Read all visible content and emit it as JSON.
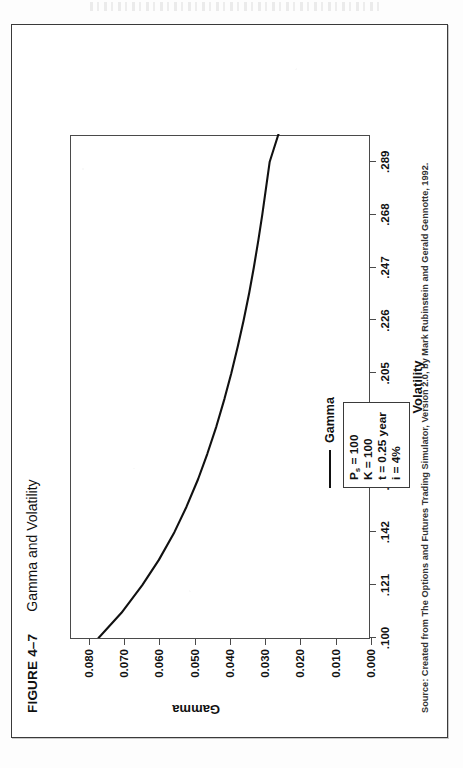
{
  "figure": {
    "number": "FIGURE 4–7",
    "title": "Gamma and Volatility"
  },
  "source_note": "Source: Created from The Options and Futures Trading Simulator, Version 2.0, by Mark Rubinstein and Gerald Gennotte, 1992.",
  "legend": {
    "series_label": "Gamma"
  },
  "parameters": {
    "lines": [
      "Pₛ = 100",
      "K = 100",
      "t = 0.25 year",
      "i = 4%"
    ],
    "spot_price": "Pₛ = 100",
    "strike": "K = 100",
    "time": "t = 0.25 year",
    "rate": "i = 4%"
  },
  "colors": {
    "ink": "#111111",
    "frame": "#3a3a3a",
    "axis": "#4a4a4a",
    "paper": "#fdfdfd",
    "curve": "#111111"
  },
  "chart_data": {
    "type": "line",
    "title": "Gamma and Volatility",
    "xlabel": "Volatility",
    "ylabel": "Gamma",
    "xlim": [
      0.1,
      0.3
    ],
    "ylim": [
      0.0,
      0.085
    ],
    "grid": false,
    "legend_position": "inside-bottom-left",
    "xtick_labels": [
      ".100",
      ".121",
      ".142",
      ".163",
      ".184",
      ".205",
      ".226",
      ".247",
      ".268",
      ".289"
    ],
    "xtick_values": [
      0.1,
      0.121,
      0.142,
      0.163,
      0.184,
      0.205,
      0.226,
      0.247,
      0.268,
      0.289
    ],
    "ytick_labels": [
      "0.000",
      "0.010",
      "0.020",
      "0.030",
      "0.040",
      "0.050",
      "0.060",
      "0.070",
      "0.080"
    ],
    "ytick_values": [
      0.0,
      0.01,
      0.02,
      0.03,
      0.04,
      0.05,
      0.06,
      0.07,
      0.08
    ],
    "series": [
      {
        "name": "Gamma",
        "x": [
          0.1,
          0.11,
          0.121,
          0.131,
          0.142,
          0.152,
          0.163,
          0.173,
          0.184,
          0.195,
          0.205,
          0.216,
          0.226,
          0.237,
          0.247,
          0.258,
          0.268,
          0.279,
          0.289,
          0.3
        ],
        "y": [
          0.0772,
          0.0707,
          0.0648,
          0.0601,
          0.0557,
          0.0523,
          0.049,
          0.0464,
          0.0438,
          0.0415,
          0.0396,
          0.0377,
          0.0361,
          0.0345,
          0.0332,
          0.0319,
          0.0308,
          0.0297,
          0.0287,
          0.0262
        ]
      }
    ],
    "annotations": [
      "Pₛ = 100",
      "K = 100",
      "t = 0.25 year",
      "i = 4%"
    ]
  }
}
